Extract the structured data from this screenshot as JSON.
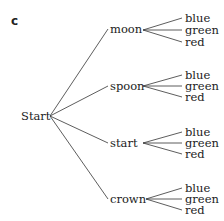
{
  "panel_label": "c",
  "root": {
    "label": "Start"
  },
  "branches": [
    {
      "label": "moon",
      "leaves": [
        "blue",
        "green",
        "red"
      ]
    },
    {
      "label": "spoon",
      "leaves": [
        "blue",
        "green",
        "red"
      ]
    },
    {
      "label": "start",
      "leaves": [
        "blue",
        "green",
        "red"
      ]
    },
    {
      "label": "crown",
      "leaves": [
        "blue",
        "green",
        "red"
      ]
    }
  ]
}
